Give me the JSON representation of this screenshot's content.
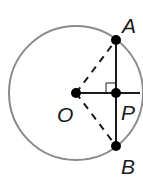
{
  "diagram": {
    "type": "circle-chord-perpendicular",
    "circle": {
      "center": "O",
      "stroke_color": "#8a8a8a"
    },
    "points": {
      "O": {
        "label": "O"
      },
      "A": {
        "label": "A"
      },
      "P": {
        "label": "P"
      },
      "B": {
        "label": "B"
      }
    },
    "segments": [
      {
        "from": "A",
        "to": "B",
        "style": "solid",
        "note": "chord AB"
      },
      {
        "from": "O",
        "to": "P",
        "style": "solid",
        "note": "extends to circle edge"
      },
      {
        "from": "O",
        "to": "A",
        "style": "dashed",
        "note": "radius OA"
      },
      {
        "from": "O",
        "to": "B",
        "style": "dashed",
        "note": "radius OB"
      }
    ],
    "marks": [
      {
        "type": "right-angle",
        "at": "P"
      }
    ],
    "colors": {
      "line": "#1a1a1a",
      "circle": "#8a8a8a",
      "point": "#000000"
    }
  }
}
